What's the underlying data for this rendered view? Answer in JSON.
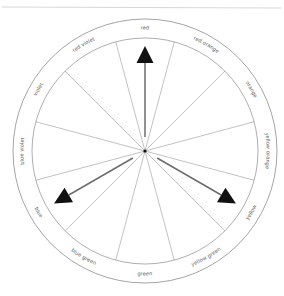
{
  "figure": {
    "top_rule_color": "#d8d8d8",
    "outline_color": "#9a9a9a",
    "spoke_color": "#a8a8a8",
    "label_color": "#5a5a5a",
    "arrow_color": "#111111",
    "background": "#ffffff"
  },
  "chart_data": {
    "type": "pie",
    "subtitle": "",
    "xlabel": "",
    "ylabel": "",
    "legend": "none",
    "grid": false,
    "center": {
      "x": 145,
      "y": 151
    },
    "outer_radius": 132,
    "inner_radius": 113,
    "segment_count": 12,
    "segment_degrees": 30,
    "categories": [
      "red",
      "red orange",
      "orange",
      "yellow orange",
      "yellow",
      "yellow green",
      "green",
      "blue green",
      "blue",
      "blue violet",
      "violet",
      "red violet"
    ],
    "values": [
      30,
      30,
      30,
      30,
      30,
      30,
      30,
      30,
      30,
      30,
      30,
      30
    ],
    "angles_deg": [
      0,
      30,
      60,
      90,
      120,
      150,
      180,
      210,
      240,
      270,
      300,
      330
    ],
    "annotations": [
      {
        "label": "red",
        "angle_deg": 0,
        "length": 105,
        "type": "arrow"
      },
      {
        "label": "yellow",
        "angle_deg": 120,
        "length": 105,
        "type": "arrow"
      },
      {
        "label": "blue",
        "angle_deg": 240,
        "length": 105,
        "type": "arrow"
      }
    ]
  },
  "wheel": {
    "labels": [
      {
        "text": "red",
        "angle_deg": 0
      },
      {
        "text": "red orange",
        "angle_deg": 30
      },
      {
        "text": "orange",
        "angle_deg": 60
      },
      {
        "text": "yellow orange",
        "angle_deg": 90
      },
      {
        "text": "yellow",
        "angle_deg": 120
      },
      {
        "text": "yellow green",
        "angle_deg": 150
      },
      {
        "text": "green",
        "angle_deg": 180
      },
      {
        "text": "blue green",
        "angle_deg": 210
      },
      {
        "text": "blue",
        "angle_deg": 240
      },
      {
        "text": "blue violet",
        "angle_deg": 270
      },
      {
        "text": "violet",
        "angle_deg": 300
      },
      {
        "text": "red violet",
        "angle_deg": 330
      }
    ],
    "arrows": [
      {
        "name": "red-arrow",
        "angle_deg": 0
      },
      {
        "name": "yellow-arrow",
        "angle_deg": 120
      },
      {
        "name": "blue-arrow",
        "angle_deg": 240
      }
    ]
  }
}
